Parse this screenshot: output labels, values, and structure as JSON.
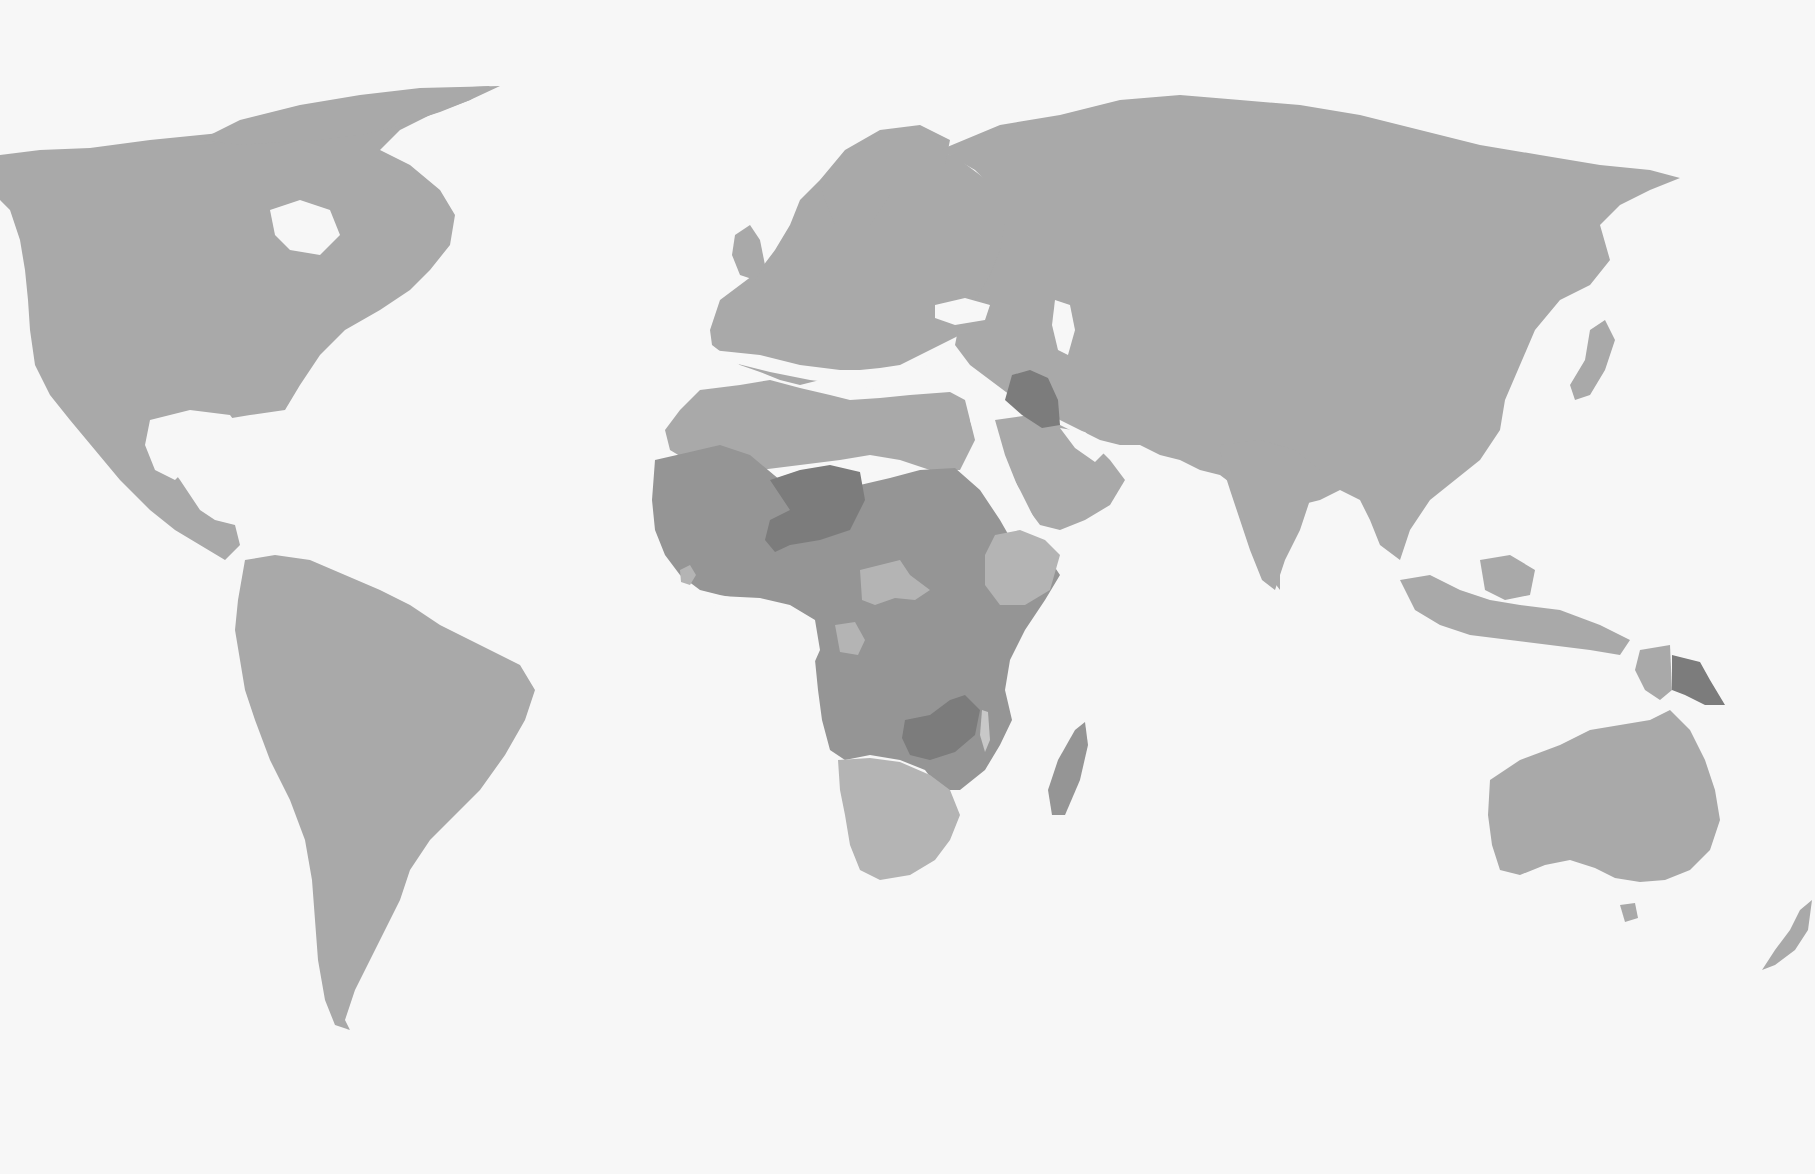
{
  "map": {
    "type": "choropleth",
    "projection": "miller-like world",
    "background_color": "#f7f7f7",
    "legend": null,
    "title": null,
    "shade_levels": {
      "base": "#a9a9a9",
      "light": "#b4b4b4",
      "medium": "#959595",
      "dark": "#7c7c7c"
    },
    "highlighted_regions": [
      {
        "name": "Niger",
        "level": "dark"
      },
      {
        "name": "Zambia",
        "level": "dark"
      },
      {
        "name": "Iraq",
        "level": "dark"
      },
      {
        "name": "Papua New Guinea",
        "level": "dark"
      },
      {
        "name": "Sahel / West Africa",
        "level": "medium"
      },
      {
        "name": "Central & East Africa",
        "level": "medium"
      },
      {
        "name": "Central African Republic",
        "level": "light"
      },
      {
        "name": "Ethiopia",
        "level": "light"
      },
      {
        "name": "Southern Africa",
        "level": "light"
      },
      {
        "name": "Gabon / Eq. Guinea",
        "level": "light"
      },
      {
        "name": "Sierra Leone",
        "level": "light"
      }
    ]
  }
}
